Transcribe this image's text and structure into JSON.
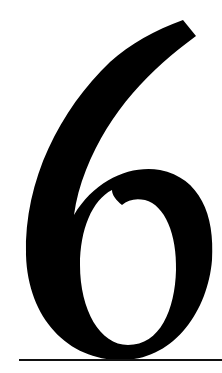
{
  "glyph": {
    "character": "6",
    "color": "#000000"
  },
  "baseline": {
    "color": "#111111"
  }
}
